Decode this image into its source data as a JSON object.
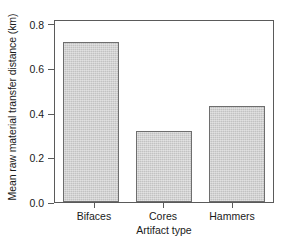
{
  "chart_data": {
    "type": "bar",
    "title": "",
    "xlabel": "Artifact type",
    "ylabel": "Mean raw material transfer distance (km)",
    "categories": [
      "Bifaces",
      "Cores",
      "Hammers"
    ],
    "values": [
      0.75,
      0.335,
      0.45
    ],
    "ylim": [
      0.0,
      0.85
    ],
    "yticks": [
      "0.0",
      "0.2",
      "0.4",
      "0.6",
      "0.8"
    ],
    "ytick_values": [
      0.0,
      0.2,
      0.4,
      0.6,
      0.8
    ],
    "grid": false,
    "legend": "none",
    "bar_color": "#c9c9c9",
    "bar_edge_color": "#6e6e6e",
    "axis_color": "#5a5a5a",
    "background_color": "#ffffff"
  }
}
